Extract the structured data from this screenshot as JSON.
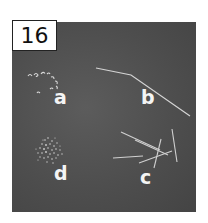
{
  "figure": {
    "number": "16",
    "panels": [
      {
        "label": "a",
        "description": "small curved comma-shaped forms arranged in an arc"
      },
      {
        "label": "b",
        "description": "single long bent filament"
      },
      {
        "label": "c",
        "description": "several straight rod-like filaments crossing"
      },
      {
        "label": "d",
        "description": "dense cluster of fine granules"
      }
    ]
  },
  "colors": {
    "background": "#4e4e4e",
    "foreground": "#e8e8e8",
    "label_box": "#ffffff"
  }
}
